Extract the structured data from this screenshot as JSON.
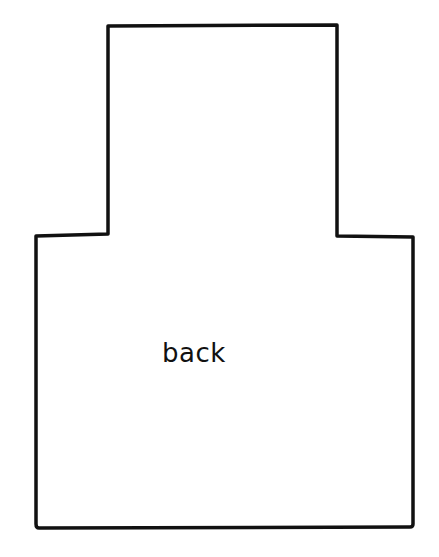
{
  "diagram": {
    "type": "pattern-piece-outline",
    "label": "back",
    "stroke_color": "#111111",
    "background": "#ffffff",
    "shape": {
      "top_panel": {
        "left": 108,
        "right": 337,
        "top": 26,
        "shoulder_y": 235
      },
      "bottom_panel": {
        "left": 36,
        "right": 413,
        "top": 235,
        "bottom": 527
      }
    }
  }
}
